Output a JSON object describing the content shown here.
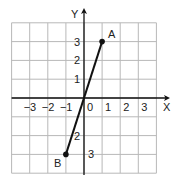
{
  "chart_data": {
    "type": "line",
    "title": "",
    "xlabel": "X",
    "ylabel": "Y",
    "xlim": [
      -4,
      4
    ],
    "ylim": [
      -4,
      4
    ],
    "grid": true,
    "x_ticks": [
      "-3",
      "-2",
      "-1",
      "0",
      "1",
      "2",
      "3"
    ],
    "y_ticks": [
      "3",
      "2",
      "1",
      "-1",
      "-2",
      "-3"
    ],
    "y_tick_display": [
      "3",
      "2",
      "1",
      "",
      "2",
      "3"
    ],
    "series": [
      {
        "name": "segment AB",
        "points": [
          {
            "label": "B",
            "x": -1,
            "y": -3
          },
          {
            "label": "A",
            "x": 1,
            "y": 3
          }
        ]
      }
    ],
    "origin_label": "0"
  },
  "colors": {
    "grid": "#b8b8b8",
    "axis": "#111111",
    "line": "#111111"
  }
}
